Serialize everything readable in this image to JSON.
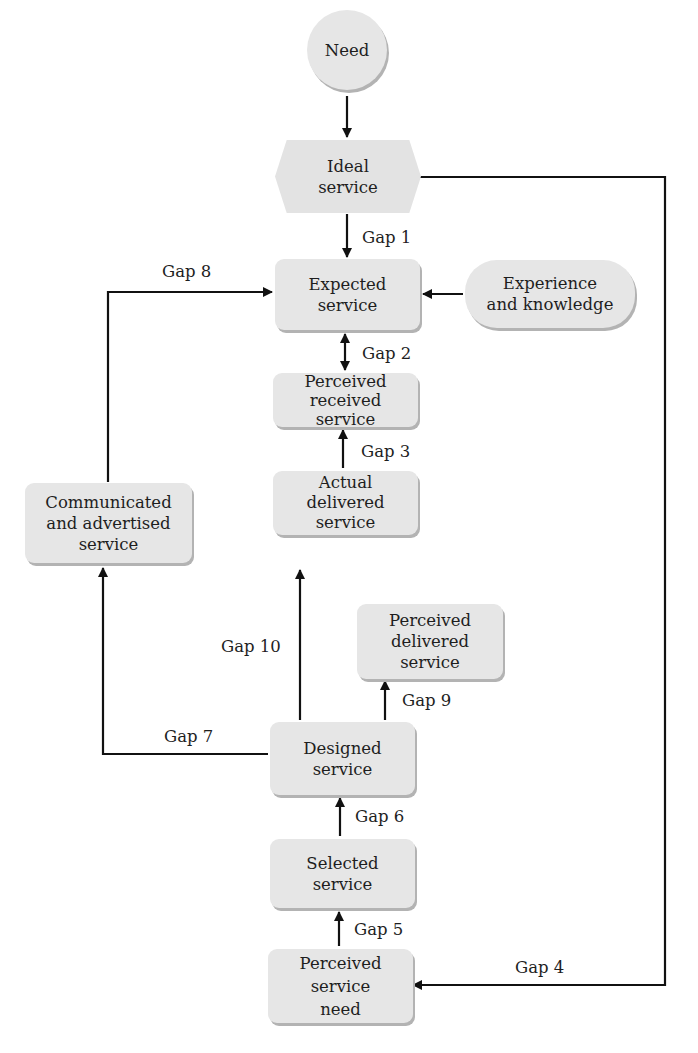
{
  "nodes": {
    "need": "Need",
    "ideal_service": "Ideal\nservice",
    "expected_service": "Expected\nservice",
    "experience_knowledge": "Experience\nand knowledge",
    "perceived_received_service": "Perceived\nreceived\nservice",
    "actual_delivered_service": "Actual\ndelivered\nservice",
    "communicated_advertised_service": "Communicated\nand advertised\nservice",
    "perceived_delivered_service": "Perceived\ndelivered\nservice",
    "designed_service": "Designed\nservice",
    "selected_service": "Selected\nservice",
    "perceived_service_need": "Perceived\nservice\nneed"
  },
  "gaps": {
    "gap1": "Gap 1",
    "gap2": "Gap 2",
    "gap3": "Gap 3",
    "gap4": "Gap 4",
    "gap5": "Gap 5",
    "gap6": "Gap 6",
    "gap7": "Gap 7",
    "gap8": "Gap 8",
    "gap9": "Gap 9",
    "gap10": "Gap 10"
  },
  "edges": [
    {
      "from": "Need",
      "to": "Ideal service",
      "label": ""
    },
    {
      "from": "Ideal service",
      "to": "Expected service",
      "label": "Gap 1"
    },
    {
      "from": "Expected service",
      "to": "Perceived received service",
      "label": "Gap 2",
      "bidirectional": true
    },
    {
      "from": "Actual delivered service",
      "to": "Perceived received service",
      "label": "Gap 3"
    },
    {
      "from": "Ideal service",
      "to": "Perceived service need",
      "label": "Gap 4"
    },
    {
      "from": "Perceived service need",
      "to": "Selected service",
      "label": "Gap 5"
    },
    {
      "from": "Selected service",
      "to": "Designed service",
      "label": "Gap 6"
    },
    {
      "from": "Designed service",
      "to": "Communicated and advertised service",
      "label": "Gap 7"
    },
    {
      "from": "Communicated and advertised service",
      "to": "Expected service",
      "label": "Gap 8"
    },
    {
      "from": "Designed service",
      "to": "Perceived delivered service",
      "label": "Gap 9"
    },
    {
      "from": "Designed service",
      "to": "Actual delivered service",
      "label": "Gap 10"
    },
    {
      "from": "Experience and knowledge",
      "to": "Expected service",
      "label": ""
    }
  ]
}
